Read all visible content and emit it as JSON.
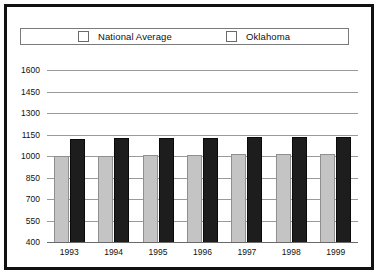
{
  "chart_data": {
    "type": "bar",
    "title": "",
    "subtitle": "",
    "xlabel": "",
    "ylabel": "",
    "categories": [
      "1993",
      "1994",
      "1995",
      "1996",
      "1997",
      "1998",
      "1999"
    ],
    "series": [
      {
        "name": "National Average",
        "color": "#c4c4c4",
        "values": [
          1000,
          1000,
          1007,
          1008,
          1013,
          1013,
          1012
        ]
      },
      {
        "name": "Oklahoma",
        "color": "#1d1d1d",
        "values": [
          1120,
          1124,
          1127,
          1129,
          1130,
          1136,
          1130
        ]
      }
    ],
    "ylim": [
      400,
      1600
    ],
    "yticks": [
      1600,
      1450,
      1300,
      1150,
      1000,
      850,
      700,
      550,
      400
    ],
    "ytick_labels": [
      "1600",
      "1450",
      "1300",
      "1150",
      "1000",
      "850",
      "700",
      "550",
      "400"
    ],
    "grid": true,
    "legend_position": "top"
  },
  "legend": {
    "entries": [
      {
        "label": "National Average",
        "swatch": "legend-swatch-national-average"
      },
      {
        "label": "Oklahoma",
        "swatch": "legend-swatch-oklahoma"
      }
    ]
  },
  "colors": {
    "national_average": "#c4c4c4",
    "oklahoma": "#1d1d1d",
    "gridline": "#9a9a9a",
    "border": "#111111",
    "background": "#ffffff"
  }
}
